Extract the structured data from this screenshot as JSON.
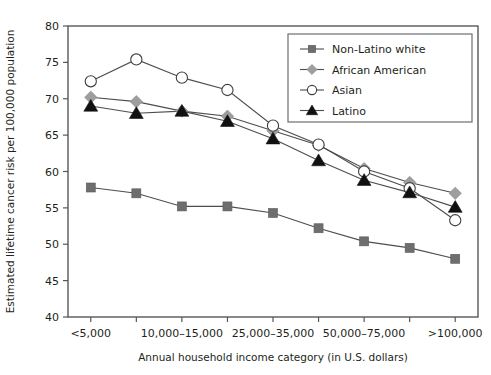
{
  "chart_data": {
    "type": "line",
    "title": "",
    "xlabel": "Annual household income category (in U.S. dollars)",
    "ylabel": "Estimated lifetime cancer risk per 100,000 population",
    "ylim": [
      40,
      80
    ],
    "ytick_values": [
      40,
      45,
      50,
      55,
      60,
      65,
      70,
      75,
      80
    ],
    "ytick_labels": [
      "40",
      "45",
      "50",
      "55",
      "60",
      "65",
      "70",
      "75",
      "80"
    ],
    "grid": false,
    "legend_position": "top-right",
    "categories": [
      "<5,000",
      "5,000-10,000",
      "10,000-15,000",
      "15,000-25,000",
      "25,000-35,000",
      "35,000-50,000",
      "50,000-75,000",
      "75,000-100,000",
      ">100,000"
    ],
    "xtick_labels_shown": [
      "<5,000",
      "",
      "10,000–15,000",
      "",
      "25,000–35,000",
      "",
      "50,000–75,000",
      "",
      ">100,000"
    ],
    "series": [
      {
        "name": "Non-Latino white",
        "marker": "square",
        "marker_color": "#6e6e6e",
        "line_color": "#4d4d4d",
        "values": [
          57.8,
          57.0,
          55.2,
          55.2,
          54.3,
          52.2,
          50.4,
          49.5,
          48.0
        ]
      },
      {
        "name": "African American",
        "marker": "diamond",
        "marker_color": "#9e9e9e",
        "line_color": "#4d4d4d",
        "values": [
          70.2,
          69.6,
          68.3,
          67.6,
          65.6,
          63.6,
          60.4,
          58.5,
          57.0
        ]
      },
      {
        "name": "Asian",
        "marker": "circle",
        "marker_color": "#ffffff",
        "line_color": "#4d4d4d",
        "values": [
          72.4,
          75.4,
          72.9,
          71.2,
          66.3,
          63.7,
          60.0,
          57.7,
          53.3
        ]
      },
      {
        "name": "Latino",
        "marker": "triangle",
        "marker_color": "#111111",
        "line_color": "#4d4d4d",
        "values": [
          69.0,
          68.0,
          68.3,
          66.9,
          64.5,
          61.5,
          58.8,
          57.1,
          55.1
        ]
      }
    ]
  },
  "legend": {
    "items": [
      {
        "label": "Non-Latino white",
        "marker": "square"
      },
      {
        "label": "African American",
        "marker": "diamond"
      },
      {
        "label": "Asian",
        "marker": "circle"
      },
      {
        "label": "Latino",
        "marker": "triangle"
      }
    ]
  },
  "colors": {
    "axis": "#58585a",
    "text": "#231f20",
    "square_fill": "#6e6e6e",
    "diamond_fill": "#9e9e9e",
    "circle_fill": "#ffffff",
    "triangle_fill": "#111111",
    "line": "#4d4d4d",
    "legend_border": "#6d6e71"
  }
}
